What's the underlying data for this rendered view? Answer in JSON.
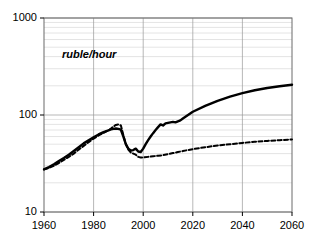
{
  "chart_data": {
    "type": "line",
    "title": "",
    "subtitle": "",
    "annotation": "ruble/hour",
    "xlabel": "",
    "ylabel": "",
    "yscale": "log",
    "xscale": "linear",
    "xlim": [
      1960,
      2060
    ],
    "ylim": [
      10,
      1000
    ],
    "grid": true,
    "minor_grid": true,
    "legend_position": "none",
    "y_ticks": [
      10,
      100,
      1000
    ],
    "y_tick_labels": [
      "10",
      "100",
      "1000"
    ],
    "y_minor_ticks": [
      20,
      30,
      40,
      50,
      60,
      70,
      80,
      90,
      200,
      300,
      400,
      500,
      600,
      700,
      800,
      900
    ],
    "x_ticks": [
      1960,
      1980,
      2000,
      2020,
      2040,
      2060
    ],
    "x_tick_labels": [
      "1960",
      "1980",
      "2000",
      "2020",
      "2040",
      "2060"
    ],
    "series": [
      {
        "name": "solid-projection",
        "style": "solid",
        "color": "#000000",
        "width": 2.4,
        "x": [
          1960,
          1962,
          1964,
          1966,
          1968,
          1970,
          1972,
          1974,
          1976,
          1978,
          1980,
          1982,
          1984,
          1986,
          1987,
          1988,
          1989,
          1990,
          1991,
          1992,
          1993,
          1994,
          1995,
          1996,
          1997,
          1998,
          1999,
          2000,
          2001,
          2002,
          2003,
          2004,
          2005,
          2006,
          2007,
          2008,
          2009,
          2010,
          2011,
          2012,
          2013,
          2014,
          2015,
          2016,
          2020,
          2025,
          2030,
          2035,
          2040,
          2045,
          2050,
          2055,
          2060
        ],
        "y": [
          27.5,
          29,
          31,
          33.5,
          36,
          39,
          42.5,
          46.5,
          51,
          55,
          59,
          63,
          66.5,
          69.5,
          71,
          72,
          72.5,
          72,
          70.5,
          60,
          50,
          45,
          43,
          43.5,
          45,
          42,
          41.5,
          45,
          50,
          55,
          60,
          65,
          70,
          75,
          80,
          78,
          82,
          83,
          84,
          85,
          84,
          86,
          88,
          92,
          108,
          124,
          140,
          155,
          168,
          180,
          190,
          198,
          205
        ]
      },
      {
        "name": "dashed-scenario",
        "style": "dashed",
        "color": "#000000",
        "width": 2.0,
        "x": [
          1960,
          1962,
          1964,
          1966,
          1968,
          1970,
          1972,
          1974,
          1976,
          1978,
          1980,
          1982,
          1984,
          1986,
          1987,
          1988,
          1989,
          1990,
          1991,
          1992,
          1993,
          1994,
          1995,
          1996,
          1997,
          1998,
          1999,
          2000,
          2002,
          2004,
          2006,
          2008,
          2010,
          2012,
          2014,
          2016,
          2018,
          2020,
          2025,
          2030,
          2035,
          2040,
          2045,
          2050,
          2055,
          2060
        ],
        "y": [
          27.5,
          28.5,
          30,
          32,
          34.5,
          37,
          40,
          44,
          48,
          52.5,
          57,
          61.5,
          65.5,
          69.5,
          72.5,
          76,
          79,
          80,
          78,
          62,
          50,
          44,
          41,
          40,
          39,
          37,
          36.5,
          36.5,
          37,
          37.5,
          38,
          38.5,
          39.5,
          40.5,
          41.5,
          42.5,
          43.5,
          44.5,
          46.5,
          48.5,
          50,
          51.5,
          53,
          54,
          55,
          56
        ]
      }
    ]
  }
}
